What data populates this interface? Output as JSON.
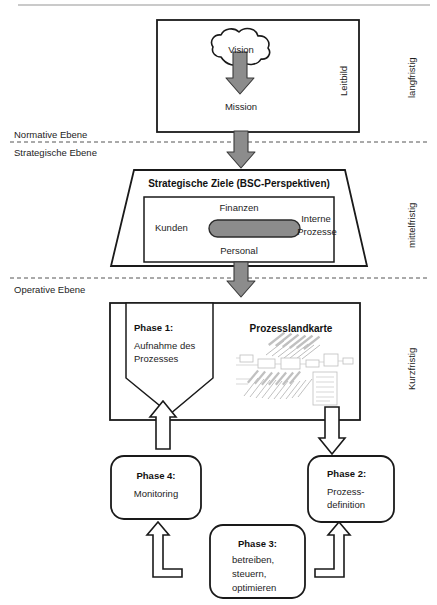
{
  "diagram": {
    "levels": [
      {
        "label": "Normative Ebene"
      },
      {
        "label": "Strategische Ebene"
      },
      {
        "label": "Operative Ebene"
      }
    ],
    "horizons": [
      {
        "label": "langfristig"
      },
      {
        "label": "mittelfristig"
      },
      {
        "label": "Kurzfristig"
      }
    ],
    "normative": {
      "side_label": "Leitbild",
      "cloud_label": "Vision",
      "below_label": "Mission"
    },
    "strategic": {
      "heading": "Strategische Ziele (BSC-Perspektiven)",
      "perspectives": {
        "top": "Finanzen",
        "left": "Kunden",
        "right_line1": "Interne",
        "right_line2": "Prozesse",
        "bottom": "Personal"
      }
    },
    "operative": {
      "phase1_title": "Phase 1:",
      "phase1_line1": "Aufnahme des",
      "phase1_line2": "Prozesses",
      "map_title": "Prozesslandkarte"
    },
    "phases": [
      {
        "id": "phase-4",
        "title": "Phase 4:",
        "lines": [
          "Monitoring"
        ]
      },
      {
        "id": "phase-2",
        "title": "Phase 2:",
        "lines": [
          "Prozess-",
          "definition"
        ]
      },
      {
        "id": "phase-3",
        "title": "Phase 3:",
        "lines": [
          "betreiben,",
          "steuern,",
          "optimieren"
        ]
      }
    ],
    "colors": {
      "stroke": "#1a1a1a",
      "arrow_fill_gray": "#8c8c8c",
      "arrow_fill_white": "#ffffff",
      "bsc_center_fill": "#8c8c8c",
      "divider": "#555555",
      "top_rule": "#b9b9b9"
    }
  }
}
